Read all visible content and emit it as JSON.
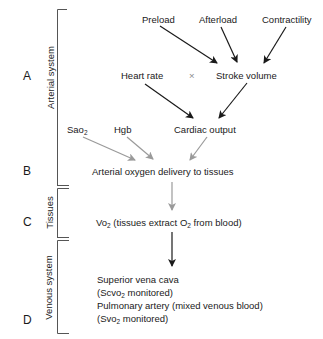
{
  "sections": [
    {
      "letter": "A",
      "system_label": "Arterial system"
    },
    {
      "letter": "B"
    },
    {
      "letter": "C",
      "system_label": "Tissues"
    },
    {
      "letter": "D",
      "system_label": "Venous system"
    }
  ],
  "nodes": {
    "preload": "Preload",
    "afterload": "Afterload",
    "contractility": "Contractility",
    "heart_rate": "Heart rate",
    "multiply": "×",
    "stroke_volume": "Stroke volume",
    "sao2_base": "Sao",
    "sao2_sub": "2",
    "hgb": "Hgb",
    "cardiac_output": "Cardiac output",
    "arterial_delivery": "Arterial oxygen delivery to tissues",
    "vo2_base": "Vo",
    "vo2_sub": "2",
    "vo2_text_a": " (tissues extract O",
    "vo2_text_sub": "2",
    "vo2_text_b": " from blood)",
    "venous_line1": "Superior vena cava",
    "venous_line2_a": "(Scvo",
    "venous_line2_sub": "2",
    "venous_line2_b": " monitored)",
    "venous_line3": "Pulmonary artery (mixed venous blood)",
    "venous_line4_a": "(Svo",
    "venous_line4_sub": "2",
    "venous_line4_b": " monitored)"
  },
  "colors": {
    "dark_arrow": "#1a1a1a",
    "gray_arrow": "#9a9a9a",
    "bracket": "#555555"
  }
}
